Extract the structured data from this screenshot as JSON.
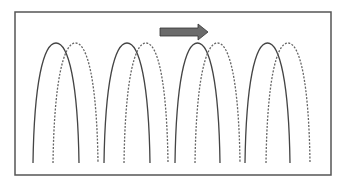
{
  "diagram": {
    "type": "wave-propagation",
    "frame": {
      "x": 15,
      "y": 12,
      "width": 316,
      "height": 163,
      "stroke": "#555555"
    },
    "arrow": {
      "direction": "right",
      "x1": 160,
      "x2": 208,
      "y": 32,
      "color": "#6b6b6b",
      "stroke": "#333333"
    },
    "arch_base_y": 163,
    "arch_peak_y": 43,
    "solid_arches": [
      {
        "left": 33,
        "right": 79
      },
      {
        "left": 104,
        "right": 150
      },
      {
        "left": 175,
        "right": 220
      },
      {
        "left": 245,
        "right": 290
      }
    ],
    "dashed_arches": [
      {
        "left": 53,
        "right": 98
      },
      {
        "left": 124,
        "right": 168
      },
      {
        "left": 195,
        "right": 240
      },
      {
        "left": 266,
        "right": 310
      }
    ],
    "solid_color": "#444444",
    "dashed_color": "#666666"
  }
}
